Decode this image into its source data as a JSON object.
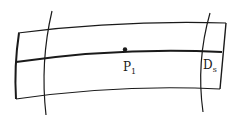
{
  "diagram": {
    "type": "curved band with cross-sections",
    "colors": {
      "background": "#ffffff",
      "stroke": "#1a1a1a"
    },
    "labels": {
      "point": {
        "main": "P",
        "subscript": "1"
      },
      "section": {
        "main": "D",
        "subscript": "s"
      }
    },
    "elements": [
      {
        "name": "band-top-edge",
        "kind": "curve"
      },
      {
        "name": "band-centerline",
        "kind": "curve",
        "weight": "thick"
      },
      {
        "name": "band-bottom-edge",
        "kind": "curve"
      },
      {
        "name": "band-left-end",
        "kind": "curve",
        "weight": "thick"
      },
      {
        "name": "band-right-end",
        "kind": "curve"
      },
      {
        "name": "left-cross-arc",
        "kind": "arc"
      },
      {
        "name": "right-cross-arc",
        "kind": "arc"
      },
      {
        "name": "point-p1",
        "kind": "point"
      }
    ]
  }
}
